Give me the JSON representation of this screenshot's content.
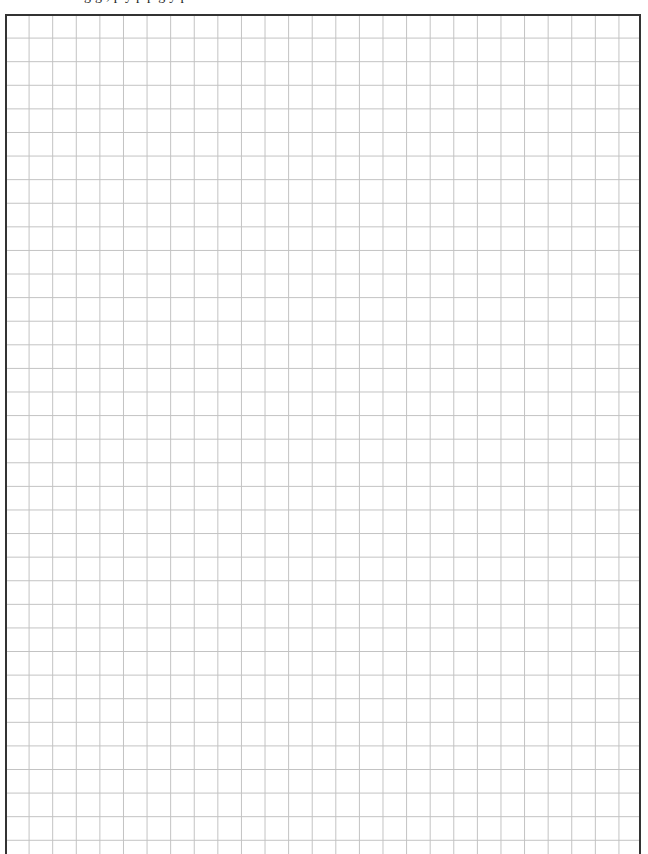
{
  "page": {
    "type": "graph-paper worksheet",
    "cropped_header_text": "g g ,       p   y           p   p     g y   p",
    "cropped_header_note": "Only descenders of a cut-off text line are visible"
  },
  "grid": {
    "columns": 27,
    "rows_visible": 35,
    "cell_size_px": 23.6,
    "line_color": "#c2c2c2",
    "border_color": "#333333",
    "background_color": "#ffffff"
  }
}
